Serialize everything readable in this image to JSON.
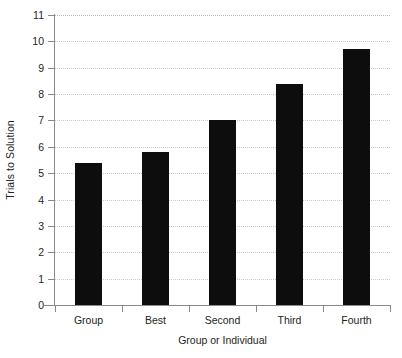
{
  "chart_data": {
    "type": "bar",
    "title": "",
    "xlabel": "Group or Individual",
    "ylabel": "Trials to Solution",
    "categories": [
      "Group",
      "Best",
      "Second",
      "Third",
      "Fourth"
    ],
    "values": [
      5.4,
      5.8,
      7.0,
      8.4,
      9.7
    ],
    "ylim": [
      0,
      11
    ],
    "yticks": [
      0,
      1,
      2,
      3,
      4,
      5,
      6,
      7,
      8,
      9,
      10,
      11
    ],
    "ytick_labels": [
      "0",
      "1",
      "2",
      "3",
      "4",
      "5",
      "6",
      "7",
      "8",
      "9",
      "10",
      "11"
    ],
    "grid": true,
    "grid_axis": "y",
    "legend": "none",
    "bar_color": "#0d0d0d",
    "axis_color": "#8a8a8a",
    "grid_color": "#c9c9c9",
    "background": "#ffffff"
  }
}
